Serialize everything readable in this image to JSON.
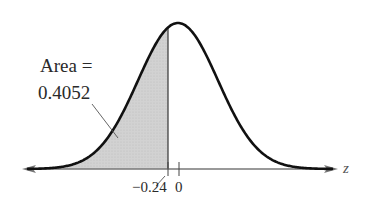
{
  "chart_data": {
    "type": "area",
    "title": "",
    "distribution": "standard normal",
    "xlabel": "z",
    "ylabel": "",
    "mean": 0,
    "std": 1,
    "shaded_region": {
      "from": "-inf",
      "to": -0.24,
      "area": 0.4052
    },
    "ticks": [
      {
        "value": -0.24,
        "label": "−0.24"
      },
      {
        "value": 0,
        "label": "0"
      }
    ],
    "annotation": {
      "line1": "Area =",
      "line2": "0.4052"
    },
    "grid": false,
    "legend": null
  },
  "colors": {
    "curve": "#111111",
    "shade": "#cfcfcf",
    "axis": "#777777",
    "text": "#2a2a2a"
  }
}
